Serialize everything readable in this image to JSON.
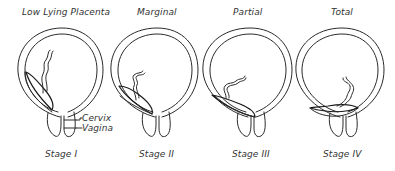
{
  "diagram": {
    "panels": [
      {
        "title": "Low Lying Placenta",
        "stage": "Stage I"
      },
      {
        "title": "Marginal",
        "stage": "Stage II"
      },
      {
        "title": "Partial",
        "stage": "Stage III"
      },
      {
        "title": "Total",
        "stage": "Stage IV"
      }
    ],
    "annotations": {
      "cervix": "Cervix",
      "vagina": "Vagina"
    },
    "colors": {
      "line": "#2a2a2a",
      "background": "#ffffff"
    }
  }
}
